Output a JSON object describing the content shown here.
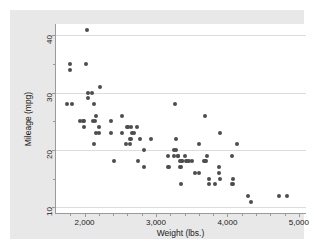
{
  "chart_data": {
    "type": "scatter",
    "title": "",
    "xlabel": "Weight (lbs.)",
    "ylabel": "Mileage (mpg)",
    "xlim": [
      1600,
      5100
    ],
    "ylim": [
      9,
      42
    ],
    "grid": true,
    "legend": null,
    "x_ticks_major": [
      2000,
      3000,
      4000,
      5000
    ],
    "x_tick_labels": [
      "2,000",
      "3,000",
      "4,000",
      "5,000"
    ],
    "x_ticks_minor": [
      1800,
      2200,
      2400,
      2600,
      2800,
      3200,
      3400,
      3600,
      3800,
      4200,
      4400,
      4600,
      4800
    ],
    "y_ticks_major": [
      10,
      20,
      30,
      40
    ],
    "y_tick_labels": [
      "10",
      "20",
      "30",
      "40"
    ],
    "y_ticks_minor": [
      15,
      25,
      35
    ],
    "marker_color": "#4d4d4d",
    "grid_color": "#dcdcdc",
    "plot_bg": "#ffffff",
    "graph_bg": "#e8e8e8",
    "axis_color": "#9a9a9a",
    "points": [
      {
        "x": 2930,
        "y": 22
      },
      {
        "x": 3350,
        "y": 17
      },
      {
        "x": 2640,
        "y": 22
      },
      {
        "x": 3250,
        "y": 20
      },
      {
        "x": 4080,
        "y": 15
      },
      {
        "x": 3670,
        "y": 18
      },
      {
        "x": 3690,
        "y": 26
      },
      {
        "x": 3280,
        "y": 20
      },
      {
        "x": 3880,
        "y": 16
      },
      {
        "x": 3400,
        "y": 19
      },
      {
        "x": 3330,
        "y": 17
      },
      {
        "x": 3900,
        "y": 23
      },
      {
        "x": 4330,
        "y": 11
      },
      {
        "x": 3900,
        "y": 15
      },
      {
        "x": 4290,
        "y": 12
      },
      {
        "x": 4080,
        "y": 14
      },
      {
        "x": 3350,
        "y": 14
      },
      {
        "x": 3600,
        "y": 21
      },
      {
        "x": 3740,
        "y": 14
      },
      {
        "x": 4840,
        "y": 12
      },
      {
        "x": 4720,
        "y": 12
      },
      {
        "x": 3830,
        "y": 14
      },
      {
        "x": 2580,
        "y": 21
      },
      {
        "x": 4060,
        "y": 14
      },
      {
        "x": 4130,
        "y": 21
      },
      {
        "x": 4060,
        "y": 19
      },
      {
        "x": 3720,
        "y": 19
      },
      {
        "x": 3370,
        "y": 18
      },
      {
        "x": 3310,
        "y": 19
      },
      {
        "x": 2830,
        "y": 20
      },
      {
        "x": 3370,
        "y": 18
      },
      {
        "x": 2200,
        "y": 24
      },
      {
        "x": 2520,
        "y": 26
      },
      {
        "x": 2130,
        "y": 28
      },
      {
        "x": 2650,
        "y": 24
      },
      {
        "x": 1800,
        "y": 34
      },
      {
        "x": 2730,
        "y": 24
      },
      {
        "x": 1800,
        "y": 35
      },
      {
        "x": 2050,
        "y": 29
      },
      {
        "x": 1830,
        "y": 28
      },
      {
        "x": 2410,
        "y": 18
      },
      {
        "x": 2220,
        "y": 31
      },
      {
        "x": 2120,
        "y": 25
      },
      {
        "x": 2160,
        "y": 26
      },
      {
        "x": 1980,
        "y": 25
      },
      {
        "x": 1990,
        "y": 24
      },
      {
        "x": 3280,
        "y": 22
      },
      {
        "x": 3880,
        "y": 17
      },
      {
        "x": 2520,
        "y": 23
      },
      {
        "x": 3420,
        "y": 18
      },
      {
        "x": 3500,
        "y": 18
      },
      {
        "x": 2690,
        "y": 23
      },
      {
        "x": 2200,
        "y": 23
      },
      {
        "x": 2150,
        "y": 25
      },
      {
        "x": 1930,
        "y": 25
      },
      {
        "x": 1990,
        "y": 25
      },
      {
        "x": 2670,
        "y": 23
      },
      {
        "x": 2370,
        "y": 25
      },
      {
        "x": 2130,
        "y": 21
      },
      {
        "x": 2160,
        "y": 23
      },
      {
        "x": 2370,
        "y": 23
      },
      {
        "x": 3170,
        "y": 17
      },
      {
        "x": 2830,
        "y": 17
      },
      {
        "x": 3260,
        "y": 28
      },
      {
        "x": 2050,
        "y": 30
      },
      {
        "x": 2020,
        "y": 35
      },
      {
        "x": 2040,
        "y": 41
      },
      {
        "x": 1760,
        "y": 28
      },
      {
        "x": 2750,
        "y": 18
      },
      {
        "x": 2100,
        "y": 30
      },
      {
        "x": 2780,
        "y": 22
      },
      {
        "x": 2640,
        "y": 21
      },
      {
        "x": 3550,
        "y": 16
      },
      {
        "x": 3700,
        "y": 18
      },
      {
        "x": 3690,
        "y": 18
      },
      {
        "x": 3600,
        "y": 16
      },
      {
        "x": 3740,
        "y": 15
      },
      {
        "x": 2650,
        "y": 22
      },
      {
        "x": 3310,
        "y": 19
      },
      {
        "x": 3460,
        "y": 18
      },
      {
        "x": 2610,
        "y": 24
      },
      {
        "x": 2590,
        "y": 24
      },
      {
        "x": 3180,
        "y": 17
      },
      {
        "x": 3170,
        "y": 19
      },
      {
        "x": 3250,
        "y": 19
      },
      {
        "x": 3330,
        "y": 18
      },
      {
        "x": 3430,
        "y": 18
      }
    ]
  }
}
